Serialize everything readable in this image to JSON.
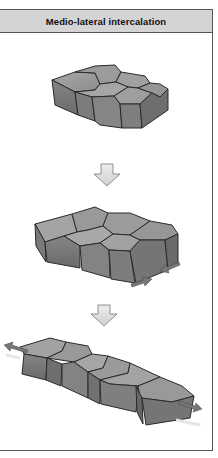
{
  "figure": {
    "title": "Medio-lateral intercalation",
    "colors": {
      "header_bg": "#d4d4d4",
      "border": "#555555",
      "block_top": "#9a9a9a",
      "block_side": "#7a7a7a",
      "block_outline": "#2a2a2a",
      "arrow_fill": "#dddddd",
      "force_arrow": "#777777"
    },
    "stages": [
      {
        "id": "stage-1",
        "description": "Compact block of cells (3x2 arrangement)"
      },
      {
        "id": "stage-2",
        "description": "Cells begin intercalating with converging arrows at the side"
      },
      {
        "id": "stage-3",
        "description": "Elongated row of cells with extension arrows at both ends"
      }
    ],
    "transition_arrows": 2
  }
}
